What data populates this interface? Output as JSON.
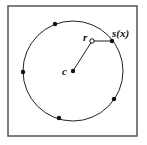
{
  "diagram": {
    "frame": {
      "x": 8,
      "y": 6,
      "width": 129,
      "height": 130,
      "stroke": "#555555"
    },
    "circle": {
      "cx": 73,
      "cy": 71,
      "r": 50,
      "stroke": "#222222"
    },
    "center": {
      "x": 73,
      "y": 71,
      "label": "c"
    },
    "query_point": {
      "x": 92,
      "y": 41,
      "label": "r"
    },
    "projection_point": {
      "x": 112,
      "y": 41,
      "label": "s(x)"
    },
    "points": [
      {
        "x": 55,
        "y": 24
      },
      {
        "x": 23,
        "y": 72
      },
      {
        "x": 59,
        "y": 118
      },
      {
        "x": 114,
        "y": 99
      }
    ],
    "segments": [
      {
        "from": "center",
        "to": "query_point"
      },
      {
        "from": "query_point",
        "to": "projection_point"
      }
    ]
  }
}
